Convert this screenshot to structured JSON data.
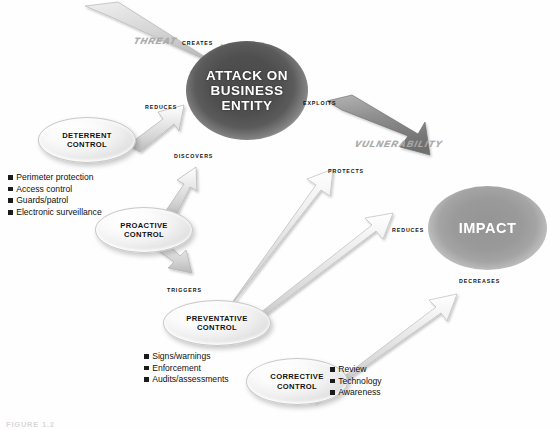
{
  "diagram": {
    "caption": "FIGURE 1.2",
    "colors": {
      "attack_blob": "#4f4f4f",
      "impact_blob": "#9a9a9a",
      "ellipse_fill": "#f0f0f0",
      "arrow_fill": "#d9d9d9",
      "arrow_stroke": "#b4b4b4",
      "threat_arrow": "#c3c3c3",
      "vulnerability_arrow": "#8d8d8d",
      "bullet_square": "#1b1b1b",
      "label_text": "#141414",
      "big_label_text": "#a9a9a9"
    }
  },
  "nodes": {
    "attack": {
      "label": "ATTACK ON BUSINESS ENTITY",
      "line1": "ATTACK ON",
      "line2": "BUSINESS",
      "line3": "ENTITY"
    },
    "impact": {
      "label": "IMPACT"
    },
    "deterrent": {
      "line1": "DETERRENT",
      "line2": "CONTROL"
    },
    "proactive": {
      "line1": "PROACTIVE",
      "line2": "CONTROL"
    },
    "preventative": {
      "line1": "PREVENTATIVE",
      "line2": "CONTROL"
    },
    "corrective": {
      "line1": "CORRECTIVE",
      "line2": "CONTROL"
    }
  },
  "flows": {
    "threat": "THREAT",
    "vulnerability": "VULNERABILITY"
  },
  "relations": {
    "creates": "CREATES",
    "reduces_attack": "REDUCES",
    "discovers": "DISCOVERS",
    "exploits": "EXPLOITS",
    "triggers": "TRIGGERS",
    "protects": "PROTECTS",
    "reduces_impact": "REDUCES",
    "decreases": "DECREASES"
  },
  "bullet_lists": {
    "deterrent_items": [
      "Perimeter protection",
      "Access control",
      "Guards/patrol",
      "Electronic surveillance"
    ],
    "preventative_items": [
      "Signs/warnings",
      "Enforcement",
      "Audits/assessments"
    ],
    "corrective_items": [
      "Review",
      "Technology",
      "Awareness"
    ]
  }
}
